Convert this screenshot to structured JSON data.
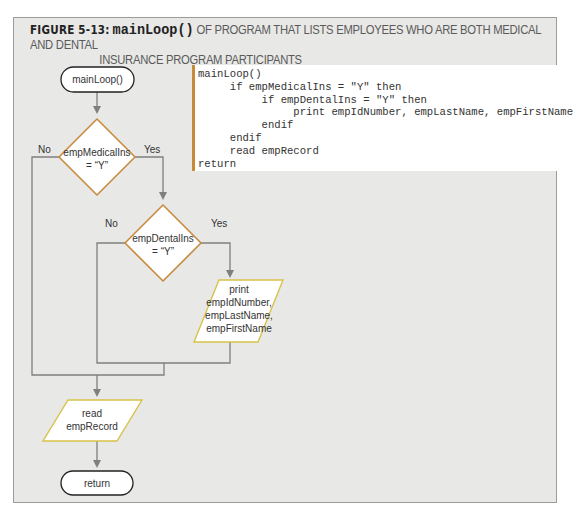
{
  "caption": {
    "figure_label": "FIGURE 5-13:",
    "function_name": "mainLoop()",
    "title_line1": " OF PROGRAM THAT LISTS EMPLOYEES WHO ARE BOTH MEDICAL AND DENTAL",
    "title_line2": "INSURANCE PROGRAM PARTICIPANTS"
  },
  "pseudocode": {
    "lines": [
      "mainLoop()",
      "     if empMedicalIns = \"Y\" then",
      "          if empDentalIns = \"Y\" then",
      "               print empIdNumber, empLastName, empFirstName",
      "          endif",
      "     endif",
      "     read empRecord",
      "return"
    ],
    "accent_color": "#c98a3c"
  },
  "flowchart": {
    "start": "mainLoop()",
    "decision1": {
      "line1": "empMedicalIns",
      "line2": "= “Y”",
      "no": "No",
      "yes": "Yes"
    },
    "decision2": {
      "line1": "empDentalIns",
      "line2": "= “Y”",
      "no": "No",
      "yes": "Yes"
    },
    "print_box": {
      "lines": [
        "print",
        "empIdNumber,",
        "empLastName,",
        "empFirstName"
      ]
    },
    "read_box": {
      "lines": [
        "read",
        "empRecord"
      ]
    },
    "end": "return",
    "colors": {
      "decision_border": "#c98a3c",
      "io_border": "#d8c24a",
      "line": "#7f7f7f"
    }
  }
}
